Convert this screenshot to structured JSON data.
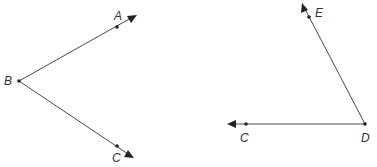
{
  "figures": [
    {
      "name": "angle-ABC",
      "vertex": {
        "label": "B",
        "x": 19,
        "y": 81,
        "label_x": 5,
        "label_y": 85
      },
      "rays": [
        {
          "through": {
            "label": "A",
            "x": 117,
            "y": 27,
            "label_x": 114,
            "label_y": 20
          },
          "tip": {
            "x": 137,
            "y": 15
          }
        },
        {
          "through": {
            "label": "C",
            "x": 117,
            "y": 146,
            "label_x": 112,
            "label_y": 162
          },
          "tip": {
            "x": 134,
            "y": 157
          }
        }
      ]
    },
    {
      "name": "angle-EDC",
      "vertex": {
        "label": "D",
        "x": 365,
        "y": 124,
        "label_x": 361,
        "label_y": 142
      },
      "rays": [
        {
          "through": {
            "label": "E",
            "x": 309,
            "y": 17,
            "label_x": 316,
            "label_y": 17
          },
          "tip": {
            "x": 302,
            "y": 3
          }
        },
        {
          "through": {
            "label": "C",
            "x": 246,
            "y": 124,
            "label_x": 240,
            "label_y": 142
          },
          "tip": {
            "x": 227,
            "y": 124
          }
        }
      ]
    }
  ],
  "labels": {
    "A": "A",
    "B": "B",
    "C1": "C",
    "D": "D",
    "E": "E",
    "C2": "C"
  },
  "colors": {
    "line": "#4a4a4a",
    "point": "#222222",
    "text": "#333333",
    "background": "#ffffff"
  }
}
